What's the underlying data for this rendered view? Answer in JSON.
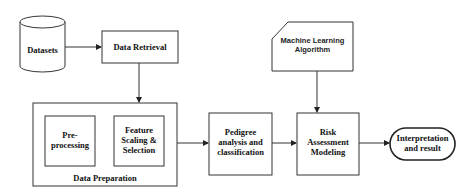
{
  "diagram": {
    "type": "flowchart",
    "nodes": {
      "datasets": {
        "label": "Datasets",
        "shape": "cylinder"
      },
      "data_retrieval": {
        "label": "Data Retrieval",
        "shape": "rectangle"
      },
      "data_preparation": {
        "label": "Data Preparation",
        "shape": "container"
      },
      "preprocessing": {
        "line1": "Pre-",
        "line2": "processing",
        "shape": "rectangle"
      },
      "feature": {
        "line1": "Feature",
        "line2": "Scaling &",
        "line3": "Selection",
        "shape": "rectangle"
      },
      "pedigree": {
        "line1": "Pedigree",
        "line2": "analysis and",
        "line3": "classification",
        "shape": "rectangle"
      },
      "ml": {
        "line1": "Machine Learning",
        "line2": "Algorithm",
        "shape": "card"
      },
      "risk": {
        "line1": "Risk",
        "line2": "Assessment",
        "line3": "Modeling",
        "shape": "rectangle"
      },
      "result": {
        "line1": "Interpretation",
        "line2": "and result",
        "shape": "terminal"
      }
    },
    "edges": [
      {
        "from": "datasets",
        "to": "data_retrieval"
      },
      {
        "from": "data_retrieval",
        "to": "data_preparation"
      },
      {
        "from": "data_preparation",
        "to": "pedigree"
      },
      {
        "from": "pedigree",
        "to": "risk"
      },
      {
        "from": "ml",
        "to": "risk"
      },
      {
        "from": "risk",
        "to": "result"
      }
    ]
  }
}
